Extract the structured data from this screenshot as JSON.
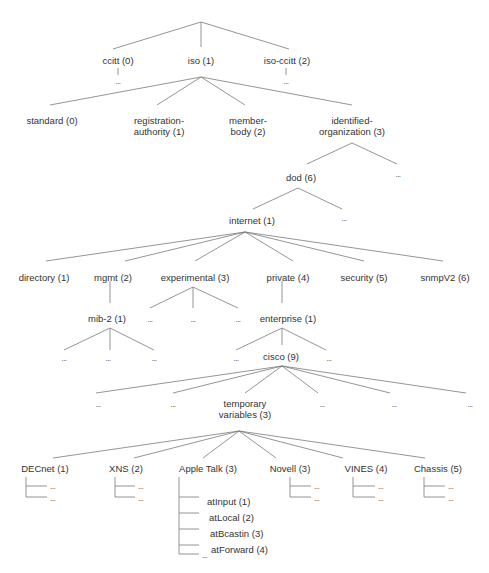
{
  "diagram": {
    "line_color": "#7a7a7a",
    "text_color": "#333333",
    "nodes": [
      {
        "id": "ccitt",
        "label": "ccitt (0)",
        "x": 118,
        "y": 55
      },
      {
        "id": "iso",
        "label": "iso (1)",
        "x": 201,
        "y": 55
      },
      {
        "id": "iso-ccitt",
        "label": "iso-ccitt (2)",
        "x": 287,
        "y": 55
      },
      {
        "id": "standard",
        "label": "standard (0)",
        "x": 52,
        "y": 115
      },
      {
        "id": "registration-authority",
        "label": "registration-\nauthority (1)",
        "x": 159,
        "y": 115
      },
      {
        "id": "member-body",
        "label": "member-\nbody (2)",
        "x": 248,
        "y": 115
      },
      {
        "id": "identified-organization",
        "label": "identified-\norganization (3)",
        "x": 352,
        "y": 115
      },
      {
        "id": "dod",
        "label": "dod (6)",
        "x": 301,
        "y": 172
      },
      {
        "id": "internet",
        "label": "internet (1)",
        "x": 252,
        "y": 215
      },
      {
        "id": "directory",
        "label": "directory (1)",
        "x": 44,
        "y": 272
      },
      {
        "id": "mgmt",
        "label": "mgmt (2)",
        "x": 113,
        "y": 272
      },
      {
        "id": "experimental",
        "label": "experimental (3)",
        "x": 195,
        "y": 272
      },
      {
        "id": "private",
        "label": "private (4)",
        "x": 288,
        "y": 272
      },
      {
        "id": "security",
        "label": "security (5)",
        "x": 364,
        "y": 272
      },
      {
        "id": "snmpV2",
        "label": "snmpV2 (6)",
        "x": 445,
        "y": 272
      },
      {
        "id": "mib-2",
        "label": "mib-2  (1)",
        "x": 107,
        "y": 313
      },
      {
        "id": "enterprise",
        "label": "enterprise (1)",
        "x": 288,
        "y": 313
      },
      {
        "id": "cisco",
        "label": "cisco (9)",
        "x": 281,
        "y": 351
      },
      {
        "id": "temporary-variables",
        "label": "temporary\nvariables (3)",
        "x": 245,
        "y": 398
      },
      {
        "id": "decnet",
        "label": "DECnet (1)",
        "x": 45,
        "y": 463
      },
      {
        "id": "xns",
        "label": "XNS (2)",
        "x": 126,
        "y": 463
      },
      {
        "id": "appletalk",
        "label": "Apple Talk (3)",
        "x": 208,
        "y": 463
      },
      {
        "id": "novell",
        "label": "Novell (3)",
        "x": 290,
        "y": 463
      },
      {
        "id": "vines",
        "label": "VINES (4)",
        "x": 366,
        "y": 463
      },
      {
        "id": "chassis",
        "label": "Chassis (5)",
        "x": 438,
        "y": 463
      }
    ],
    "leaf_labels": [
      {
        "id": "atInput",
        "label": "atInput (1)",
        "x": 207,
        "y": 496
      },
      {
        "id": "atLocal",
        "label": "atLocal (2)",
        "x": 209,
        "y": 512
      },
      {
        "id": "atBcastin",
        "label": "atBcastin (3)",
        "x": 210,
        "y": 528
      },
      {
        "id": "atForward",
        "label": "atForward (4)",
        "x": 211,
        "y": 544
      }
    ],
    "ellipsis": "...",
    "ellipses": [
      {
        "x": 118,
        "y": 78
      },
      {
        "x": 286,
        "y": 78
      },
      {
        "x": 398,
        "y": 171
      },
      {
        "x": 344,
        "y": 215
      },
      {
        "x": 150,
        "y": 316
      },
      {
        "x": 193,
        "y": 316
      },
      {
        "x": 238,
        "y": 316
      },
      {
        "x": 64,
        "y": 355
      },
      {
        "x": 108,
        "y": 355
      },
      {
        "x": 154,
        "y": 355
      },
      {
        "x": 236,
        "y": 355
      },
      {
        "x": 329,
        "y": 355
      },
      {
        "x": 98,
        "y": 401
      },
      {
        "x": 173,
        "y": 401
      },
      {
        "x": 322,
        "y": 401
      },
      {
        "x": 394,
        "y": 401
      },
      {
        "x": 470,
        "y": 401
      },
      {
        "x": 50,
        "y": 483,
        "left": true
      },
      {
        "x": 50,
        "y": 495,
        "left": true
      },
      {
        "x": 138,
        "y": 483,
        "left": true
      },
      {
        "x": 138,
        "y": 495,
        "left": true
      },
      {
        "x": 202,
        "y": 552,
        "left": true
      },
      {
        "x": 314,
        "y": 483,
        "left": true
      },
      {
        "x": 314,
        "y": 495,
        "left": true
      },
      {
        "x": 378,
        "y": 483,
        "left": true
      },
      {
        "x": 378,
        "y": 495,
        "left": true
      },
      {
        "x": 448,
        "y": 483,
        "left": true
      },
      {
        "x": 448,
        "y": 495,
        "left": true
      }
    ],
    "edges": [
      [
        201,
        22,
        113,
        49
      ],
      [
        201,
        22,
        201,
        47
      ],
      [
        201,
        22,
        289,
        49
      ],
      [
        118,
        68,
        118,
        75
      ],
      [
        286,
        68,
        286,
        75
      ],
      [
        201,
        77,
        50,
        105
      ],
      [
        201,
        77,
        157,
        105
      ],
      [
        201,
        77,
        245,
        105
      ],
      [
        201,
        77,
        352,
        105
      ],
      [
        352,
        143,
        307,
        164
      ],
      [
        352,
        143,
        397,
        164
      ],
      [
        298,
        188,
        253,
        209
      ],
      [
        298,
        188,
        342,
        209
      ],
      [
        245,
        232,
        46,
        261
      ],
      [
        245,
        232,
        125,
        261
      ],
      [
        245,
        232,
        195,
        261
      ],
      [
        245,
        232,
        293,
        261
      ],
      [
        245,
        232,
        364,
        261
      ],
      [
        245,
        232,
        443,
        261
      ],
      [
        110,
        281,
        110,
        303
      ],
      [
        193,
        287,
        150,
        308
      ],
      [
        193,
        287,
        193,
        308
      ],
      [
        193,
        287,
        238,
        308
      ],
      [
        282,
        281,
        282,
        303
      ],
      [
        110,
        328,
        64,
        350
      ],
      [
        110,
        328,
        110,
        350
      ],
      [
        110,
        328,
        154,
        350
      ],
      [
        282,
        328,
        236,
        350
      ],
      [
        282,
        328,
        282,
        345
      ],
      [
        282,
        328,
        326,
        350
      ],
      [
        282,
        366,
        96,
        393
      ],
      [
        282,
        366,
        173,
        393
      ],
      [
        282,
        366,
        245,
        393
      ],
      [
        282,
        366,
        318,
        393
      ],
      [
        282,
        366,
        390,
        393
      ],
      [
        282,
        366,
        466,
        393
      ],
      [
        239,
        431,
        53,
        458
      ],
      [
        239,
        431,
        134,
        458
      ],
      [
        239,
        431,
        203,
        458
      ],
      [
        239,
        431,
        276,
        458
      ],
      [
        239,
        431,
        343,
        458
      ],
      [
        239,
        431,
        425,
        458
      ],
      [
        26,
        477,
        26,
        497
      ],
      [
        26,
        486,
        47,
        486
      ],
      [
        26,
        497,
        47,
        497
      ],
      [
        115,
        477,
        115,
        497
      ],
      [
        115,
        486,
        135,
        486
      ],
      [
        115,
        497,
        135,
        497
      ],
      [
        179,
        477,
        179,
        554
      ],
      [
        179,
        497,
        199,
        497
      ],
      [
        179,
        513,
        199,
        513
      ],
      [
        179,
        529,
        199,
        529
      ],
      [
        179,
        545,
        199,
        545
      ],
      [
        179,
        554,
        199,
        554
      ],
      [
        290,
        477,
        290,
        497
      ],
      [
        290,
        486,
        311,
        486
      ],
      [
        290,
        497,
        311,
        497
      ],
      [
        353,
        477,
        353,
        497
      ],
      [
        353,
        486,
        375,
        486
      ],
      [
        353,
        497,
        375,
        497
      ],
      [
        424,
        477,
        424,
        497
      ],
      [
        424,
        486,
        445,
        486
      ],
      [
        424,
        497,
        445,
        497
      ]
    ]
  }
}
